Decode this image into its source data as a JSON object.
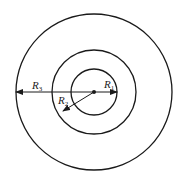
{
  "diagram": {
    "type": "concentric-circles",
    "stroke_color": "#1a1a1a",
    "center": {
      "x": 94,
      "y": 92
    },
    "circles": [
      {
        "name": "inner",
        "radius": 23
      },
      {
        "name": "middle",
        "radius": 42
      },
      {
        "name": "outer",
        "radius": 78
      }
    ],
    "labels": {
      "r1": {
        "main": "R",
        "sub": "1"
      },
      "r2": {
        "main": "R",
        "sub": "2"
      },
      "r3": {
        "main": "R",
        "sub": "3"
      }
    }
  }
}
